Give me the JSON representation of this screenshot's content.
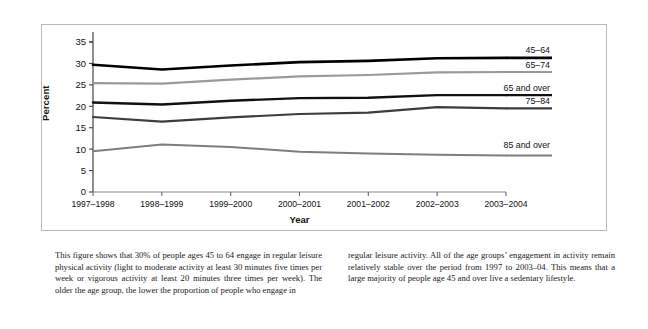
{
  "figure": {
    "y_axis_title": "Percent",
    "x_axis_title": "Year"
  },
  "chart_data": {
    "type": "line",
    "title": "",
    "xlabel": "Year",
    "ylabel": "Percent",
    "ylim": [
      0,
      35
    ],
    "yticks": [
      "0",
      "5",
      "10",
      "15",
      "20",
      "25",
      "30",
      "35"
    ],
    "grid": false,
    "legend_position": "right-inline",
    "categories": [
      "1997–1998",
      "1998–1999",
      "1999–2000",
      "2000–2001",
      "2001–2002",
      "2002–2003",
      "2003–2004"
    ],
    "series": [
      {
        "name": "45–64",
        "color": "#000000",
        "width": 2.6,
        "values": [
          29.7,
          28.6,
          29.5,
          30.3,
          30.6,
          31.2,
          31.3
        ]
      },
      {
        "name": "65–74",
        "color": "#9a9a9a",
        "width": 2.2,
        "values": [
          25.4,
          25.3,
          26.2,
          27.0,
          27.3,
          27.9,
          28.0
        ]
      },
      {
        "name": "65 and over",
        "color": "#111111",
        "width": 2.4,
        "values": [
          20.9,
          20.4,
          21.3,
          21.9,
          22.0,
          22.6,
          22.6
        ]
      },
      {
        "name": "75–84",
        "color": "#3d3d3d",
        "width": 2.2,
        "values": [
          17.5,
          16.4,
          17.4,
          18.2,
          18.5,
          19.8,
          19.5
        ]
      },
      {
        "name": "85 and over",
        "color": "#7e7e7e",
        "width": 2.0,
        "values": [
          9.5,
          11.1,
          10.5,
          9.4,
          9.0,
          8.7,
          8.5
        ]
      }
    ]
  },
  "caption": {
    "left": "This figure shows that 30% of people ages 45 to 64 engage in regular leisure physical activity (light to moderate activity at least 30 minutes five times per week or vigorous activity at least 20 minutes three times per week). The older the age group, the lower the proportion of people who engage in",
    "right": "regular leisure activity. All of the age groups’ engagement in activity remain relatively stable over the period from 1997 to 2003–04. This means that a large majority of people age 45 and over live a sedentary lifestyle."
  }
}
